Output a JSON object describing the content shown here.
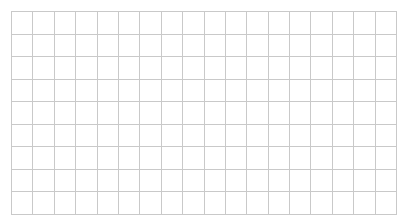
{
  "grid": {
    "columns": 18,
    "rows": 9,
    "line_color": "#c9c9c9",
    "background_color": "#ffffff"
  }
}
